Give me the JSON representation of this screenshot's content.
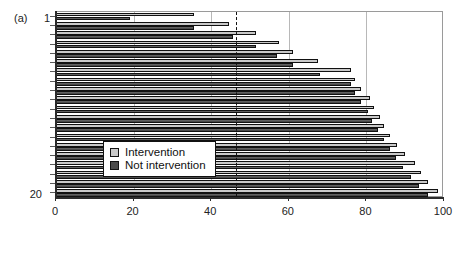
{
  "panel": {
    "label": "(a)"
  },
  "axis": {
    "y_top_label": "1",
    "y_bottom_label": "20",
    "x_ticks": [
      "0",
      "20",
      "40",
      "60",
      "80",
      "100"
    ]
  },
  "legend": {
    "items": [
      {
        "label": "Intervention",
        "color": "#c9c9c9",
        "swatch": "intervention-swatch"
      },
      {
        "label": "Not intervention",
        "color": "#4a4a4a",
        "swatch": "not-intervention-swatch"
      }
    ]
  },
  "chart_data": {
    "type": "bar",
    "orientation": "horizontal",
    "title": "",
    "xlabel": "",
    "ylabel": "",
    "xlim": [
      0,
      100
    ],
    "ylim": [
      1,
      20
    ],
    "grid": true,
    "gridlines_x": [
      20,
      40,
      60,
      80
    ],
    "reference_line": {
      "value": 46.5,
      "style": "dashed",
      "color": "#111111"
    },
    "legend_position": "center-left-inset",
    "categories": [
      "1",
      "2",
      "3",
      "4",
      "5",
      "6",
      "7",
      "8",
      "9",
      "10",
      "11",
      "12",
      "13",
      "14",
      "15",
      "16",
      "17",
      "18",
      "19",
      "20"
    ],
    "series": [
      {
        "name": "Intervention",
        "color": "#c9c9c9",
        "values": [
          35.5,
          44.5,
          51.5,
          57.5,
          61.0,
          67.5,
          76.0,
          77.0,
          78.5,
          81.0,
          82.0,
          83.5,
          84.5,
          86.0,
          88.0,
          90.0,
          92.5,
          94.0,
          96.0,
          98.5
        ]
      },
      {
        "name": "Not intervention",
        "color": "#4a4a4a",
        "values": [
          19.0,
          35.5,
          45.5,
          51.5,
          57.0,
          61.0,
          68.0,
          76.0,
          77.0,
          78.5,
          80.5,
          81.5,
          83.0,
          84.5,
          86.0,
          87.5,
          89.5,
          91.5,
          93.5,
          96.0
        ]
      }
    ]
  }
}
